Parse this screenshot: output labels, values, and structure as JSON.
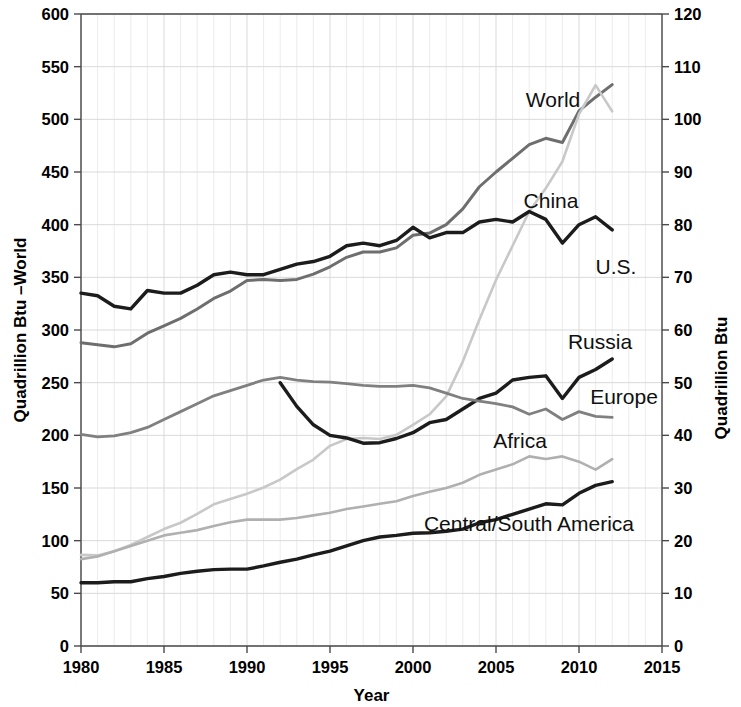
{
  "chart_data": {
    "type": "line",
    "title": "",
    "xlabel": "Year",
    "ylabel_left": "Quadrillion Btu  –World",
    "ylabel_right": "Quadrillion Btu",
    "xlim": [
      1980,
      2015
    ],
    "ylim_left": [
      0,
      600
    ],
    "ylim_right": [
      0,
      120
    ],
    "xticks": [
      "1980",
      "1985",
      "1990",
      "1995",
      "2000",
      "2005",
      "2010",
      "2015"
    ],
    "yticks_left": [
      "0",
      "50",
      "100",
      "150",
      "200",
      "250",
      "300",
      "350",
      "400",
      "450",
      "500",
      "550",
      "600"
    ],
    "yticks_right": [
      "0",
      "10",
      "20",
      "30",
      "40",
      "50",
      "60",
      "70",
      "80",
      "90",
      "100",
      "110",
      "120"
    ],
    "grid": true,
    "legend_position": "inline-labels",
    "note": "World uses left axis (0-600); all other series use right axis (0-120)",
    "series": [
      {
        "name": "World",
        "axis": "left",
        "color": "#6e6e6e",
        "width": 3.0,
        "x": [
          1980,
          1981,
          1982,
          1983,
          1984,
          1985,
          1986,
          1987,
          1988,
          1989,
          1990,
          1991,
          1992,
          1993,
          1994,
          1995,
          1996,
          1997,
          1998,
          1999,
          2000,
          2001,
          2002,
          2003,
          2004,
          2005,
          2006,
          2007,
          2008,
          2009,
          2010,
          2011,
          2012
        ],
        "values": [
          288,
          286,
          284,
          287,
          297,
          304,
          311,
          320,
          330,
          337,
          347,
          348,
          347,
          348,
          353,
          360,
          369,
          374,
          374,
          378,
          390,
          392,
          400,
          415,
          436,
          450,
          463,
          476,
          482,
          478,
          508,
          521,
          533
        ]
      },
      {
        "name": "China",
        "axis": "right",
        "color": "#c8c8c8",
        "width": 2.6,
        "x": [
          1980,
          1981,
          1982,
          1983,
          1984,
          1985,
          1986,
          1987,
          1988,
          1989,
          1990,
          1991,
          1992,
          1993,
          1994,
          1995,
          1996,
          1997,
          1998,
          1999,
          2000,
          2001,
          2002,
          2003,
          2004,
          2005,
          2006,
          2007,
          2008,
          2009,
          2010,
          2011,
          2012
        ],
        "values": [
          17.3,
          17.2,
          18.0,
          19.2,
          20.7,
          22.2,
          23.4,
          25.1,
          26.9,
          27.9,
          28.9,
          30.1,
          31.6,
          33.6,
          35.4,
          38.0,
          39.3,
          39.5,
          39.3,
          40.1,
          42.0,
          44.0,
          47.4,
          54.0,
          62.0,
          69.5,
          76.0,
          82.5,
          86.9,
          92.0,
          101.0,
          106.5,
          101.5
        ]
      },
      {
        "name": "U.S.",
        "axis": "right",
        "color": "#1c1c1c",
        "width": 3.4,
        "x": [
          1980,
          1981,
          1982,
          1983,
          1984,
          1985,
          1986,
          1987,
          1988,
          1989,
          1990,
          1991,
          1992,
          1993,
          1994,
          1995,
          1996,
          1997,
          1998,
          1999,
          2000,
          2001,
          2002,
          2003,
          2004,
          2005,
          2006,
          2007,
          2008,
          2009,
          2010,
          2011,
          2012
        ],
        "values": [
          67.0,
          66.5,
          64.5,
          64.0,
          67.5,
          67.0,
          67.0,
          68.5,
          70.5,
          71.0,
          70.5,
          70.5,
          71.5,
          72.5,
          73.0,
          74.0,
          76.0,
          76.5,
          76.0,
          77.0,
          79.5,
          77.5,
          78.5,
          78.5,
          80.5,
          81.0,
          80.5,
          82.5,
          81.0,
          76.5,
          80.0,
          81.5,
          79.0
        ]
      },
      {
        "name": "Russia",
        "axis": "right",
        "color": "#1c1c1c",
        "width": 3.4,
        "x": [
          1992,
          1993,
          1994,
          1995,
          1996,
          1997,
          1998,
          1999,
          2000,
          2001,
          2002,
          2003,
          2004,
          2005,
          2006,
          2007,
          2008,
          2009,
          2010,
          2011,
          2012
        ],
        "values": [
          50.0,
          45.5,
          42.0,
          40.0,
          39.5,
          38.5,
          38.6,
          39.4,
          40.5,
          42.4,
          43.0,
          45.0,
          47.0,
          48.0,
          50.5,
          51.0,
          51.3,
          47.0,
          51.0,
          52.5,
          54.5
        ]
      },
      {
        "name": "Europe",
        "axis": "right",
        "color": "#808080",
        "width": 2.8,
        "x": [
          1980,
          1981,
          1982,
          1983,
          1984,
          1985,
          1986,
          1987,
          1988,
          1989,
          1990,
          1991,
          1992,
          1993,
          1994,
          1995,
          1996,
          1997,
          1998,
          1999,
          2000,
          2001,
          2002,
          2003,
          2004,
          2005,
          2006,
          2007,
          2008,
          2009,
          2010,
          2011,
          2012
        ],
        "values": [
          40.2,
          39.7,
          39.9,
          40.5,
          41.5,
          43.0,
          44.5,
          46.0,
          47.5,
          48.5,
          49.5,
          50.5,
          51.0,
          50.5,
          50.2,
          50.1,
          49.8,
          49.5,
          49.3,
          49.3,
          49.5,
          49.0,
          48.0,
          47.0,
          46.5,
          46.0,
          45.4,
          44.0,
          45.0,
          43.0,
          44.5,
          43.6,
          43.4
        ]
      },
      {
        "name": "Africa",
        "axis": "right",
        "color": "#b0b0b0",
        "width": 2.6,
        "x": [
          1980,
          1981,
          1982,
          1983,
          1984,
          1985,
          1986,
          1987,
          1988,
          1989,
          1990,
          1991,
          1992,
          1993,
          1994,
          1995,
          1996,
          1997,
          1998,
          1999,
          2000,
          2001,
          2002,
          2003,
          2004,
          2005,
          2006,
          2007,
          2008,
          2009,
          2010,
          2011,
          2012
        ],
        "values": [
          16.5,
          17.0,
          18.0,
          19.0,
          20.0,
          21.0,
          21.5,
          22.0,
          22.8,
          23.5,
          24.0,
          24.0,
          24.0,
          24.3,
          24.8,
          25.3,
          26.0,
          26.5,
          27.0,
          27.5,
          28.5,
          29.3,
          30.0,
          31.0,
          32.5,
          33.5,
          34.5,
          36.0,
          35.5,
          36.0,
          35.0,
          33.5,
          35.5
        ]
      },
      {
        "name": "Central/South America",
        "axis": "right",
        "color": "#1c1c1c",
        "width": 3.4,
        "x": [
          1980,
          1981,
          1982,
          1983,
          1984,
          1985,
          1986,
          1987,
          1988,
          1989,
          1990,
          1991,
          1992,
          1993,
          1994,
          1995,
          1996,
          1997,
          1998,
          1999,
          2000,
          2001,
          2002,
          2003,
          2004,
          2005,
          2006,
          2007,
          2008,
          2009,
          2010,
          2011,
          2012
        ],
        "values": [
          12.0,
          12.0,
          12.2,
          12.2,
          12.8,
          13.2,
          13.8,
          14.2,
          14.5,
          14.6,
          14.6,
          15.2,
          15.9,
          16.5,
          17.3,
          18.0,
          19.0,
          20.0,
          20.7,
          21.0,
          21.4,
          21.5,
          21.8,
          22.2,
          23.4,
          24.0,
          25.0,
          26.0,
          27.0,
          26.8,
          29.0,
          30.5,
          31.2
        ]
      }
    ],
    "inline_labels": [
      {
        "text": "World",
        "x": 553,
        "y": 107
      },
      {
        "text": "China",
        "x": 551,
        "y": 208
      },
      {
        "text": "U.S.",
        "x": 616,
        "y": 274
      },
      {
        "text": "Russia",
        "x": 600,
        "y": 349
      },
      {
        "text": "Europe",
        "x": 624,
        "y": 404
      },
      {
        "text": "Africa",
        "x": 520,
        "y": 448
      },
      {
        "text": "Central/South America",
        "x": 529,
        "y": 531
      }
    ]
  }
}
